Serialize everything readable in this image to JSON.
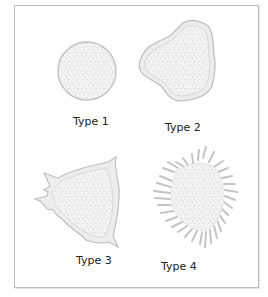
{
  "figure": {
    "panels": [
      {
        "id": "type1",
        "label": "Type 1",
        "shape": "circle"
      },
      {
        "id": "type2",
        "label": "Type 2",
        "shape": "irregular-lobed"
      },
      {
        "id": "type3",
        "label": "Type 3",
        "shape": "irregular-spiked-edges"
      },
      {
        "id": "type4",
        "label": "Type 4",
        "shape": "spiculated"
      }
    ],
    "colors": {
      "frame": "#bdbdbd",
      "fill": "#f2f2f2",
      "outline": "#b8b8b8",
      "speckle": "#9a9a9a",
      "spicule": "#c4c4c4",
      "text": "#222222"
    }
  }
}
